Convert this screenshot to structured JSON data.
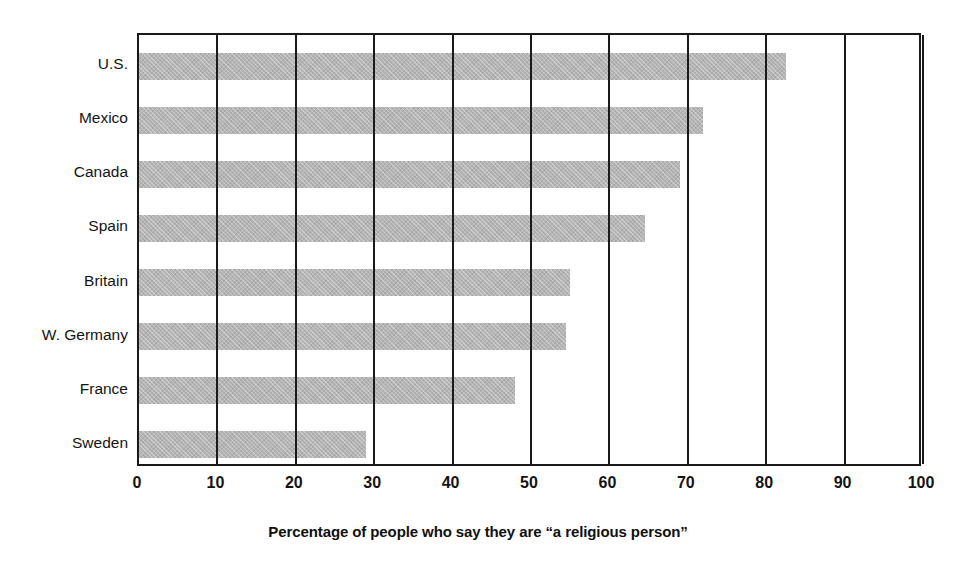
{
  "chart_data": {
    "type": "bar",
    "orientation": "horizontal",
    "title": "",
    "xlabel": "Percentage of people who say they are “a religious person”",
    "ylabel": "",
    "xlim": [
      0,
      100
    ],
    "xticks": [
      0,
      10,
      20,
      30,
      40,
      50,
      60,
      70,
      80,
      90,
      100
    ],
    "xtick_labels": [
      "0",
      "10",
      "20",
      "30",
      "40",
      "50",
      "60",
      "70",
      "80",
      "90",
      "100"
    ],
    "grid": "vertical",
    "legend": "none",
    "categories": [
      "U.S.",
      "Mexico",
      "Canada",
      "Spain",
      "Britain",
      "W. Germany",
      "France",
      "Sweden"
    ],
    "values": [
      82.5,
      72,
      69,
      64.5,
      55,
      54.5,
      48,
      29
    ],
    "series": [
      {
        "name": "Percentage saying they are a religious person",
        "values": [
          82.5,
          72,
          69,
          64.5,
          55,
          54.5,
          48,
          29
        ]
      }
    ],
    "bar_color": "#b5b5b5",
    "axis_color": "#1a1a1a",
    "background_color": "#ffffff"
  },
  "figure": {
    "cropped_title_text": "",
    "axis_title": "Percentage of people who say they are “a religious person”"
  }
}
